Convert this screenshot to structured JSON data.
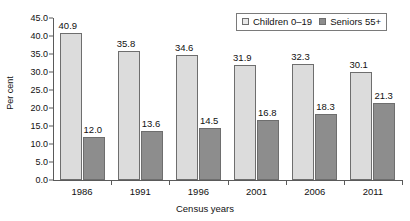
{
  "chart_data": {
    "type": "bar",
    "title": "",
    "subtitle": "",
    "xlabel": "Census years",
    "ylabel": "Per cent",
    "categories": [
      "1986",
      "1991",
      "1996",
      "2001",
      "2006",
      "2011"
    ],
    "series": [
      {
        "name": "Children 0–19",
        "color": "#dcdcdc",
        "values": [
          40.9,
          35.8,
          34.6,
          31.9,
          32.3,
          30.1
        ],
        "labels": [
          "40.9",
          "35.8",
          "34.6",
          "31.9",
          "32.3",
          "30.1"
        ]
      },
      {
        "name": "Seniors 55+",
        "color": "#8d8d8d",
        "values": [
          12.0,
          13.6,
          14.5,
          16.8,
          18.3,
          21.3
        ],
        "labels": [
          "12.0",
          "13.6",
          "14.5",
          "16.8",
          "18.3",
          "21.3"
        ]
      }
    ],
    "ylim": [
      0.0,
      45.0
    ],
    "ytick_step": 5.0,
    "yticks": [
      "0.0",
      "5.0",
      "10.0",
      "15.0",
      "20.0",
      "25.0",
      "30.0",
      "35.0",
      "40.0",
      "45.0"
    ],
    "grid": false,
    "legend_position": "top-right",
    "legend_entries": [
      "Children 0–19",
      "Seniors 55+"
    ]
  }
}
